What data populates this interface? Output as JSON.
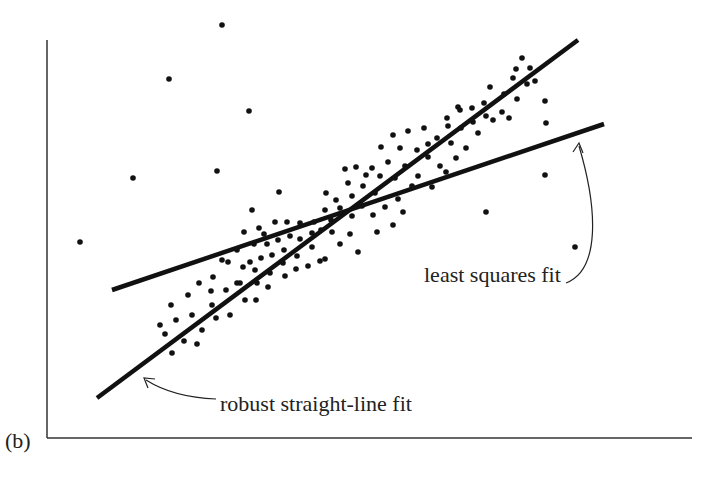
{
  "panel_label": "(b)",
  "annotations": {
    "least_squares": "least squares fit",
    "robust": "robust straight-line fit"
  },
  "colors": {
    "ink": "#111111",
    "axis": "#333333",
    "background": "#ffffff"
  },
  "chart_data": {
    "type": "scatter",
    "title": "",
    "xlabel": "",
    "ylabel": "",
    "grid": false,
    "legend": null,
    "axes": {
      "x_axis_y_px": 438,
      "y_axis_x_px": 47,
      "x_px_range": [
        47,
        692
      ],
      "y_px_range": [
        40,
        438
      ]
    },
    "annotations": [
      {
        "text": "least squares fit",
        "arrow_to_px": [
          578,
          143
        ],
        "text_px": [
          424,
          276
        ]
      },
      {
        "text": "robust straight-line fit",
        "arrow_to_px": [
          144,
          378
        ],
        "text_px": [
          220,
          405
        ]
      }
    ],
    "lines": [
      {
        "name": "robust straight-line fit",
        "p1_px": [
          97,
          398
        ],
        "p2_px": [
          578,
          40
        ]
      },
      {
        "name": "least squares fit",
        "p1_px": [
          112,
          290
        ],
        "p2_px": [
          604,
          124
        ]
      }
    ],
    "outliers_px": [
      [
        222,
        25
      ],
      [
        169,
        79
      ],
      [
        249,
        111
      ],
      [
        80,
        242
      ],
      [
        133,
        178
      ],
      [
        217,
        171
      ],
      [
        279,
        192
      ],
      [
        252,
        210
      ],
      [
        546,
        123
      ],
      [
        545,
        175
      ],
      [
        486,
        212
      ],
      [
        575,
        247
      ]
    ],
    "cluster_px": [
      [
        165,
        334
      ],
      [
        172,
        353
      ],
      [
        184,
        341
      ],
      [
        176,
        320
      ],
      [
        192,
        315
      ],
      [
        202,
        330
      ],
      [
        197,
        344
      ],
      [
        212,
        305
      ],
      [
        216,
        318
      ],
      [
        230,
        315
      ],
      [
        211,
        291
      ],
      [
        226,
        290
      ],
      [
        240,
        283
      ],
      [
        245,
        300
      ],
      [
        256,
        300
      ],
      [
        257,
        283
      ],
      [
        268,
        287
      ],
      [
        270,
        273
      ],
      [
        255,
        270
      ],
      [
        243,
        267
      ],
      [
        237,
        283
      ],
      [
        285,
        276
      ],
      [
        283,
        263
      ],
      [
        296,
        269
      ],
      [
        297,
        256
      ],
      [
        284,
        250
      ],
      [
        272,
        255
      ],
      [
        261,
        258
      ],
      [
        250,
        262
      ],
      [
        267,
        244
      ],
      [
        278,
        240
      ],
      [
        290,
        236
      ],
      [
        300,
        239
      ],
      [
        312,
        247
      ],
      [
        312,
        233
      ],
      [
        321,
        230
      ],
      [
        332,
        232
      ],
      [
        320,
        261
      ],
      [
        308,
        266
      ],
      [
        325,
        259
      ],
      [
        340,
        244
      ],
      [
        331,
        220
      ],
      [
        340,
        208
      ],
      [
        352,
        216
      ],
      [
        362,
        206
      ],
      [
        352,
        196
      ],
      [
        363,
        186
      ],
      [
        375,
        193
      ],
      [
        373,
        215
      ],
      [
        385,
        207
      ],
      [
        398,
        199
      ],
      [
        403,
        212
      ],
      [
        393,
        225
      ],
      [
        377,
        232
      ],
      [
        350,
        234
      ],
      [
        358,
        252
      ],
      [
        395,
        178
      ],
      [
        405,
        166
      ],
      [
        418,
        176
      ],
      [
        428,
        157
      ],
      [
        440,
        166
      ],
      [
        437,
        138
      ],
      [
        451,
        143
      ],
      [
        461,
        128
      ],
      [
        473,
        122
      ],
      [
        472,
        108
      ],
      [
        484,
        103
      ],
      [
        490,
        87
      ],
      [
        504,
        94
      ],
      [
        513,
        78
      ],
      [
        517,
        99
      ],
      [
        527,
        84
      ],
      [
        535,
        81
      ],
      [
        530,
        68
      ],
      [
        516,
        69
      ],
      [
        502,
        112
      ],
      [
        493,
        120
      ],
      [
        478,
        133
      ],
      [
        466,
        148
      ],
      [
        456,
        158
      ],
      [
        446,
        172
      ],
      [
        432,
        187
      ],
      [
        412,
        186
      ],
      [
        388,
        162
      ],
      [
        381,
        147
      ],
      [
        393,
        135
      ],
      [
        408,
        131
      ],
      [
        424,
        128
      ],
      [
        428,
        144
      ],
      [
        417,
        150
      ],
      [
        400,
        148
      ],
      [
        372,
        168
      ],
      [
        380,
        176
      ],
      [
        366,
        175
      ],
      [
        348,
        183
      ],
      [
        336,
        200
      ],
      [
        325,
        210
      ],
      [
        314,
        222
      ],
      [
        300,
        223
      ],
      [
        287,
        222
      ],
      [
        275,
        222
      ],
      [
        264,
        234
      ],
      [
        254,
        244
      ],
      [
        237,
        250
      ],
      [
        222,
        260
      ],
      [
        213,
        277
      ],
      [
        199,
        283
      ],
      [
        188,
        295
      ],
      [
        171,
        305
      ],
      [
        160,
        325
      ],
      [
        228,
        262
      ],
      [
        244,
        232
      ],
      [
        259,
        228
      ],
      [
        356,
        167
      ],
      [
        326,
        193
      ],
      [
        345,
        169
      ],
      [
        458,
        107
      ],
      [
        447,
        118
      ],
      [
        486,
        116
      ],
      [
        545,
        101
      ],
      [
        509,
        118
      ],
      [
        522,
        58
      ],
      [
        448,
        126
      ],
      [
        460,
        110
      ]
    ]
  }
}
